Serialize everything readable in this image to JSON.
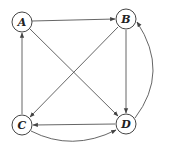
{
  "diagram": {
    "type": "directed-graph",
    "nodes": [
      {
        "id": "A",
        "label": "A",
        "x": 22,
        "y": 22
      },
      {
        "id": "B",
        "label": "B",
        "x": 126,
        "y": 19
      },
      {
        "id": "C",
        "label": "C",
        "x": 22,
        "y": 125
      },
      {
        "id": "D",
        "label": "D",
        "x": 126,
        "y": 124
      }
    ],
    "edges": [
      {
        "from": "A",
        "to": "B",
        "style": "straight"
      },
      {
        "from": "A",
        "to": "D",
        "style": "straight"
      },
      {
        "from": "B",
        "to": "D",
        "style": "straight"
      },
      {
        "from": "B",
        "to": "C",
        "style": "straight"
      },
      {
        "from": "C",
        "to": "A",
        "style": "straight"
      },
      {
        "from": "D",
        "to": "C",
        "style": "straight"
      },
      {
        "from": "C",
        "to": "D",
        "style": "curved-below"
      },
      {
        "from": "D",
        "to": "B",
        "style": "curved-right"
      }
    ],
    "colors": {
      "stroke": "#555555",
      "node_fill": "#ffffff",
      "text": "#222222"
    }
  }
}
